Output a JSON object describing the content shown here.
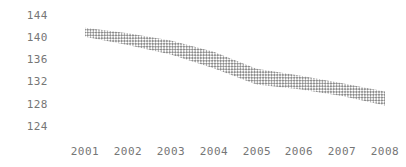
{
  "chart_data": {
    "type": "area",
    "title": "",
    "subtitle": "",
    "xlabel": "",
    "ylabel": "",
    "grid": false,
    "legend": "none",
    "band_style": "diagonal-crosshatch",
    "band_color": "#8c8c8c",
    "x": [
      2001,
      2002,
      2003,
      2004,
      2005,
      2006,
      2007,
      2008
    ],
    "x_tick_labels": [
      "2001",
      "2002",
      "2003",
      "2004",
      "2005",
      "2006",
      "2007",
      "2008"
    ],
    "y_tick_labels": [
      "144",
      "140",
      "136",
      "132",
      "128",
      "124"
    ],
    "y_ticks": [
      144,
      140,
      136,
      132,
      128,
      124
    ],
    "ylim": [
      123,
      145.5
    ],
    "xlim": [
      2000.6,
      2008.3
    ],
    "series": [
      {
        "name": "upper bound",
        "values": [
          141.7,
          140.7,
          139.4,
          137.4,
          134.3,
          133.1,
          131.7,
          130.2
        ]
      },
      {
        "name": "lower bound",
        "values": [
          140.1,
          138.6,
          136.9,
          134.4,
          131.5,
          130.6,
          129.4,
          127.7
        ]
      },
      {
        "name": "central estimate",
        "values": [
          140.9,
          139.7,
          138.2,
          135.9,
          132.9,
          131.9,
          130.6,
          129.0
        ]
      }
    ]
  },
  "axis": {
    "y_label_color": "#767676",
    "x_label_color": "#767676"
  }
}
